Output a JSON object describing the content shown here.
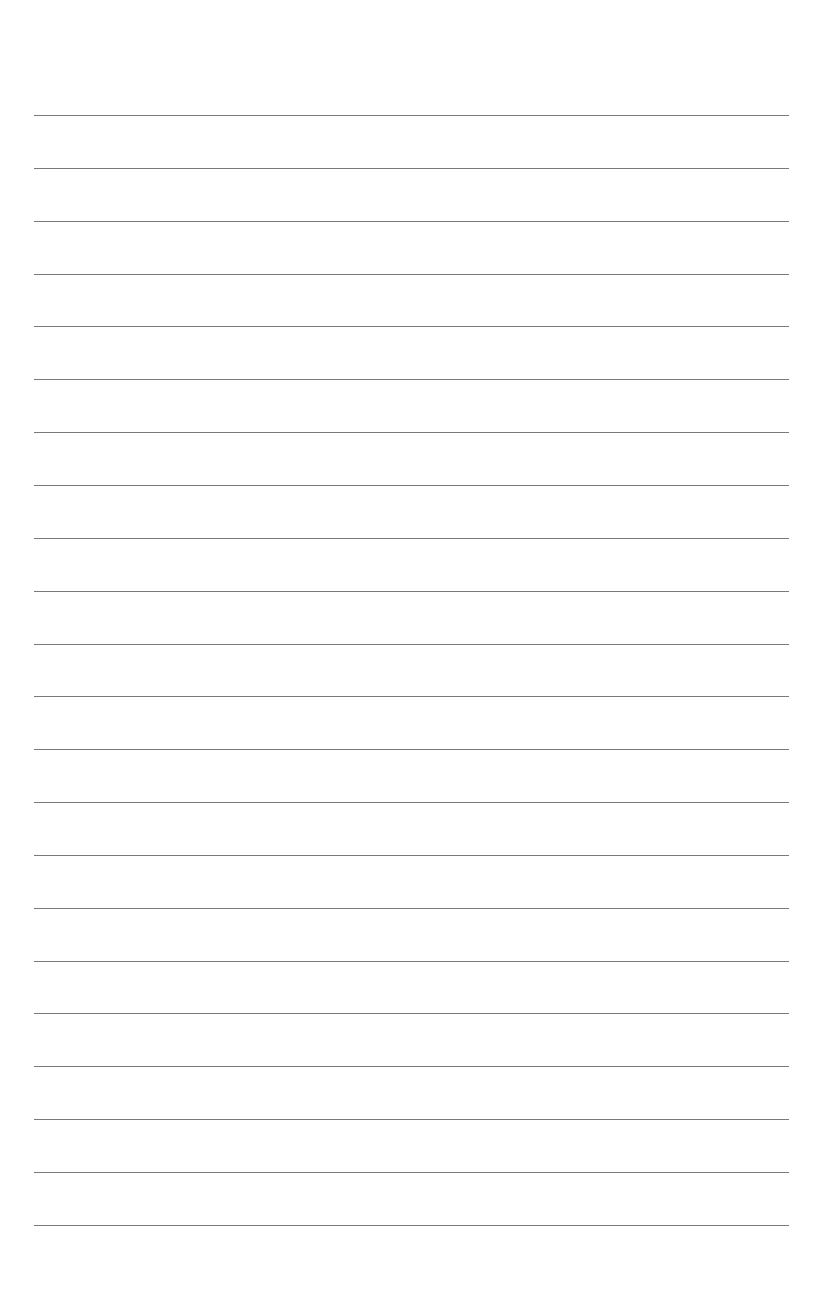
{
  "document": {
    "type": "lined-paper",
    "background_color": "#ffffff",
    "line_color": "#7a7a7a",
    "line_count": 22,
    "line_left_x": 34,
    "line_right_x": 789,
    "first_line_y": 115,
    "line_spacing": 52.85,
    "lines": [
      {
        "index": 1,
        "text": ""
      },
      {
        "index": 2,
        "text": ""
      },
      {
        "index": 3,
        "text": ""
      },
      {
        "index": 4,
        "text": ""
      },
      {
        "index": 5,
        "text": ""
      },
      {
        "index": 6,
        "text": ""
      },
      {
        "index": 7,
        "text": ""
      },
      {
        "index": 8,
        "text": ""
      },
      {
        "index": 9,
        "text": ""
      },
      {
        "index": 10,
        "text": ""
      },
      {
        "index": 11,
        "text": ""
      },
      {
        "index": 12,
        "text": ""
      },
      {
        "index": 13,
        "text": ""
      },
      {
        "index": 14,
        "text": ""
      },
      {
        "index": 15,
        "text": ""
      },
      {
        "index": 16,
        "text": ""
      },
      {
        "index": 17,
        "text": ""
      },
      {
        "index": 18,
        "text": ""
      },
      {
        "index": 19,
        "text": ""
      },
      {
        "index": 20,
        "text": ""
      },
      {
        "index": 21,
        "text": ""
      },
      {
        "index": 22,
        "text": ""
      }
    ]
  }
}
